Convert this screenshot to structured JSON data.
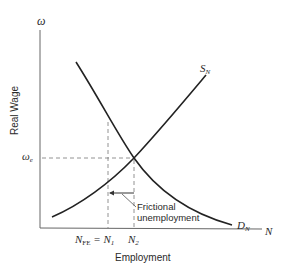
{
  "diagram": {
    "y_axis_symbol": "ω",
    "y_axis_label": "Real Wage",
    "x_axis_symbol": "N",
    "x_axis_label": "Employment",
    "equilibrium_wage_label": "ω",
    "equilibrium_wage_sub": "e",
    "supply_curve_label": "S",
    "supply_curve_sub": "N",
    "demand_curve_label": "D",
    "demand_curve_sub": "N",
    "n_fe_label": "N",
    "n_fe_sub": "FE",
    "n_fe_eq": "= N",
    "n1_sub": "1",
    "n2_label": "N",
    "n2_sub": "2",
    "annotation_line1": "Frictional",
    "annotation_line2": "unemployment",
    "colors": {
      "ink": "#2a2a2a",
      "axis": "#555555",
      "dashed": "#777777"
    }
  }
}
